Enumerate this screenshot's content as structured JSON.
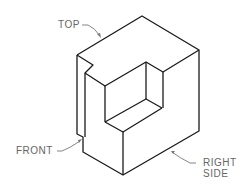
{
  "figure": {
    "type": "isometric-view",
    "labels": {
      "top": "TOP",
      "front": "FRONT",
      "right_line1": "RIGHT",
      "right_line2": "SIDE"
    },
    "colors": {
      "line": "#1a1a1a",
      "label": "#666666",
      "leader": "#777777"
    }
  }
}
